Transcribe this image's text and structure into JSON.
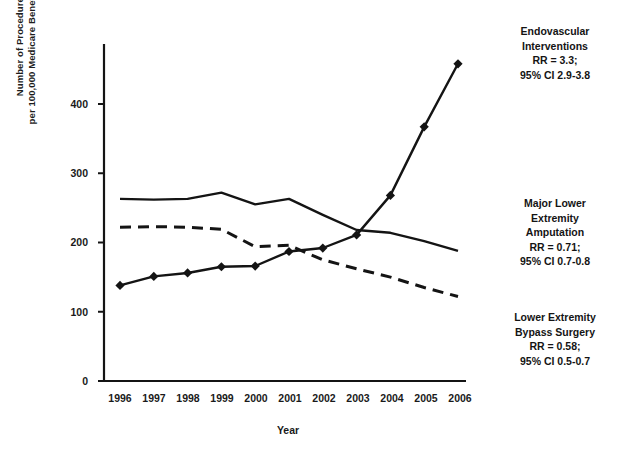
{
  "chart_data": {
    "type": "line",
    "title": "",
    "xlabel": "Year",
    "ylabel": "Number of Procedures per 100,000 Medicare Beneficiaries",
    "ylabel_line1": "Number of Procedures",
    "ylabel_line2": "per 100,000 Medicare Beneficiaries",
    "categories": [
      "1996",
      "1997",
      "1998",
      "1999",
      "2000",
      "2001",
      "2002",
      "2003",
      "2004",
      "2005",
      "2006"
    ],
    "x": [
      1996,
      1997,
      1998,
      1999,
      2000,
      2001,
      2002,
      2003,
      2004,
      2005,
      2006
    ],
    "ylim": [
      0,
      480
    ],
    "xlim": [
      1995.6,
      2006.4
    ],
    "yticks": [
      0,
      100,
      200,
      300,
      400
    ],
    "ytick_labels": [
      "0",
      "100",
      "200",
      "300",
      "400"
    ],
    "grid": false,
    "legend_position": "right-inline-annotations",
    "series": [
      {
        "name": "Endovascular Interventions",
        "style": "solid-with-diamond-markers",
        "marker": "diamond",
        "values": [
          138,
          151,
          156,
          165,
          166,
          187,
          192,
          211,
          268,
          367,
          458
        ]
      },
      {
        "name": "Major Lower Extremity Amputation",
        "style": "solid",
        "marker": "none",
        "values": [
          263,
          262,
          263,
          272,
          255,
          263,
          240,
          218,
          214,
          202,
          188
        ]
      },
      {
        "name": "Lower Extremity Bypass Surgery",
        "style": "dashed",
        "marker": "none",
        "values": [
          222,
          223,
          222,
          219,
          194,
          196,
          175,
          162,
          150,
          135,
          122
        ]
      }
    ],
    "annotations": [
      {
        "id": "endovascular",
        "line1": "Endovascular",
        "line2": "Interventions",
        "line3": "RR = 3.3;",
        "line4": "95% CI 2.9-3.8"
      },
      {
        "id": "amputation",
        "line1": "Major Lower",
        "line2": "Extremity",
        "line3": "Amputation",
        "line4": "RR = 0.71;",
        "line5": "95% CI 0.7-0.8"
      },
      {
        "id": "bypass",
        "line1": "Lower Extremity",
        "line2": "Bypass Surgery",
        "line3": "RR = 0.58;",
        "line4": "95% CI 0.5-0.7"
      }
    ]
  },
  "axis": {
    "ytick_0": "0",
    "ytick_100": "100",
    "ytick_200": "200",
    "ytick_300": "300",
    "ytick_400": "400",
    "xtick_1996": "1996",
    "xtick_1997": "1997",
    "xtick_1998": "1998",
    "xtick_1999": "1999",
    "xtick_2000": "2000",
    "xtick_2001": "2001",
    "xtick_2002": "2002",
    "xtick_2003": "2003",
    "xtick_2004": "2004",
    "xtick_2005": "2005",
    "xtick_2006": "2006",
    "xaxis_title": "Year"
  },
  "colors": {
    "ink": "#141414",
    "background": "#ffffff"
  }
}
